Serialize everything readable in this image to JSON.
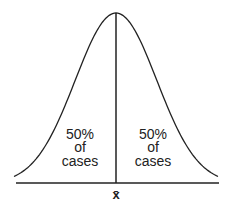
{
  "chart_data": {
    "type": "line",
    "title": "",
    "xlabel": "x̄",
    "ylabel": "",
    "series": [
      {
        "name": "normal distribution",
        "mean": 0,
        "sd": 1,
        "x_range": [
          -2.5,
          2.5
        ]
      }
    ],
    "mean_line": {
      "label": "x̄",
      "position": 0
    },
    "annotations": [
      {
        "region": "left",
        "lines": [
          "50%",
          "of",
          "cases"
        ]
      },
      {
        "region": "right",
        "lines": [
          "50%",
          "of",
          "cases"
        ]
      }
    ],
    "grid": false,
    "legend": null
  },
  "colors": {
    "stroke": "#222222",
    "background": "#ffffff"
  }
}
